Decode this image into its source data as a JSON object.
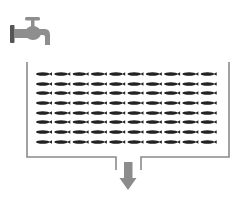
{
  "diagram": {
    "colors": {
      "background": "#ffffff",
      "wall": "#8a8a8a",
      "fish": "#222222",
      "arrow": "#8c8c8c",
      "faucet_body": "#8e8e8e",
      "faucet_flange": "#555555"
    },
    "faucet": {
      "icon": "faucet-icon",
      "x": 10,
      "y": 14,
      "width": 40,
      "height": 32
    },
    "tank": {
      "left": 27,
      "right": 229,
      "top": 62,
      "bottom": 157,
      "open_top": true
    },
    "outlet": {
      "left": 116,
      "right": 141,
      "bottom": 170
    },
    "arrow": {
      "icon": "arrow-down-icon",
      "cx": 128,
      "shaft_top": 162,
      "head_top": 178,
      "tip": 190
    },
    "fish_grid": {
      "icon": "fish-icon",
      "rows": 8,
      "columns": 10,
      "start_x": 36,
      "pitch_x": 18.3,
      "row_y": [
        74,
        84,
        93,
        103,
        113,
        122,
        132,
        142
      ],
      "fish_length": 16,
      "fish_height": 3.4
    }
  }
}
